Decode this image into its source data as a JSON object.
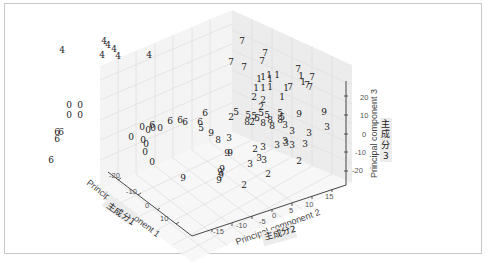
{
  "chart_data": {
    "type": "scatter",
    "subtype": "3d-scatter-text-markers",
    "title": "",
    "axes": {
      "x": {
        "label": "Principal component 1",
        "annotation": "主成分1",
        "ticks": [
          "-20",
          "-10",
          "0",
          "10"
        ]
      },
      "y": {
        "label": "Principal component 2",
        "annotation": "主成分2",
        "ticks": [
          "-15",
          "-10",
          "-5",
          "0",
          "5",
          "10",
          "15"
        ]
      },
      "z": {
        "label": "Principal component 3",
        "annotation": "主成分\n3",
        "ticks": [
          "-20",
          "-10",
          "0",
          "10",
          "20"
        ]
      }
    },
    "grid": true,
    "legend": null,
    "marker_labels": [
      "0",
      "1",
      "2",
      "3",
      "4",
      "5",
      "6",
      "7",
      "8",
      "9"
    ],
    "points_px": [
      {
        "l": "4",
        "x": 62,
        "y": 53
      },
      {
        "l": "4",
        "x": 104,
        "y": 44
      },
      {
        "l": "4",
        "x": 108,
        "y": 48
      },
      {
        "l": "4",
        "x": 114,
        "y": 52
      },
      {
        "l": "4",
        "x": 102,
        "y": 58
      },
      {
        "l": "4",
        "x": 118,
        "y": 59
      },
      {
        "l": "4",
        "x": 149,
        "y": 58
      },
      {
        "l": "7",
        "x": 231,
        "y": 65
      },
      {
        "l": "7",
        "x": 242,
        "y": 44
      },
      {
        "l": "7",
        "x": 244,
        "y": 70
      },
      {
        "l": "7",
        "x": 265,
        "y": 56
      },
      {
        "l": "7",
        "x": 262,
        "y": 64
      },
      {
        "l": "7",
        "x": 298,
        "y": 72
      },
      {
        "l": "7",
        "x": 312,
        "y": 80
      },
      {
        "l": "7",
        "x": 307,
        "y": 88
      },
      {
        "l": "7",
        "x": 310,
        "y": 90
      },
      {
        "l": "7",
        "x": 290,
        "y": 90
      },
      {
        "l": "1",
        "x": 259,
        "y": 82
      },
      {
        "l": "1",
        "x": 263,
        "y": 80
      },
      {
        "l": "1",
        "x": 269,
        "y": 78
      },
      {
        "l": "1",
        "x": 277,
        "y": 78
      },
      {
        "l": "1",
        "x": 256,
        "y": 91
      },
      {
        "l": "1",
        "x": 263,
        "y": 91
      },
      {
        "l": "1",
        "x": 270,
        "y": 90
      },
      {
        "l": "1",
        "x": 286,
        "y": 91
      },
      {
        "l": "1",
        "x": 301,
        "y": 79
      },
      {
        "l": "1",
        "x": 303,
        "y": 85
      },
      {
        "l": "1",
        "x": 282,
        "y": 100
      },
      {
        "l": "1",
        "x": 270,
        "y": 82
      },
      {
        "l": "2",
        "x": 254,
        "y": 100
      },
      {
        "l": "2",
        "x": 263,
        "y": 103
      },
      {
        "l": "2",
        "x": 261,
        "y": 110
      },
      {
        "l": "2",
        "x": 231,
        "y": 120
      },
      {
        "l": "2",
        "x": 252,
        "y": 125
      },
      {
        "l": "2",
        "x": 255,
        "y": 152
      },
      {
        "l": "2",
        "x": 299,
        "y": 164
      },
      {
        "l": "2",
        "x": 268,
        "y": 177
      },
      {
        "l": "2",
        "x": 244,
        "y": 188
      },
      {
        "l": "5",
        "x": 236,
        "y": 115
      },
      {
        "l": "5",
        "x": 254,
        "y": 119
      },
      {
        "l": "5",
        "x": 261,
        "y": 116
      },
      {
        "l": "5",
        "x": 267,
        "y": 118
      },
      {
        "l": "5",
        "x": 280,
        "y": 116
      },
      {
        "l": "5",
        "x": 282,
        "y": 120
      },
      {
        "l": "5",
        "x": 201,
        "y": 131
      },
      {
        "l": "5",
        "x": 257,
        "y": 121
      },
      {
        "l": "5",
        "x": 248,
        "y": 118
      },
      {
        "l": "8",
        "x": 280,
        "y": 123
      },
      {
        "l": "8",
        "x": 270,
        "y": 123
      },
      {
        "l": "8",
        "x": 263,
        "y": 126
      },
      {
        "l": "8",
        "x": 272,
        "y": 129
      },
      {
        "l": "8",
        "x": 218,
        "y": 143
      },
      {
        "l": "8",
        "x": 247,
        "y": 125
      },
      {
        "l": "3",
        "x": 285,
        "y": 128
      },
      {
        "l": "3",
        "x": 292,
        "y": 134
      },
      {
        "l": "3",
        "x": 327,
        "y": 130
      },
      {
        "l": "3",
        "x": 277,
        "y": 148
      },
      {
        "l": "3",
        "x": 285,
        "y": 144
      },
      {
        "l": "3",
        "x": 292,
        "y": 148
      },
      {
        "l": "3",
        "x": 305,
        "y": 147
      },
      {
        "l": "3",
        "x": 263,
        "y": 150
      },
      {
        "l": "3",
        "x": 286,
        "y": 146
      },
      {
        "l": "3",
        "x": 259,
        "y": 161
      },
      {
        "l": "3",
        "x": 264,
        "y": 163
      },
      {
        "l": "3",
        "x": 250,
        "y": 167
      },
      {
        "l": "3",
        "x": 229,
        "y": 141
      },
      {
        "l": "3",
        "x": 309,
        "y": 136
      },
      {
        "l": "9",
        "x": 299,
        "y": 117
      },
      {
        "l": "9",
        "x": 324,
        "y": 115
      },
      {
        "l": "9",
        "x": 211,
        "y": 136
      },
      {
        "l": "9",
        "x": 227,
        "y": 156
      },
      {
        "l": "9",
        "x": 230,
        "y": 156
      },
      {
        "l": "9",
        "x": 222,
        "y": 172
      },
      {
        "l": "9",
        "x": 220,
        "y": 175
      },
      {
        "l": "9",
        "x": 221,
        "y": 178
      },
      {
        "l": "9",
        "x": 219,
        "y": 183
      },
      {
        "l": "9",
        "x": 183,
        "y": 181
      },
      {
        "l": "6",
        "x": 205,
        "y": 116
      },
      {
        "l": "6",
        "x": 170,
        "y": 124
      },
      {
        "l": "6",
        "x": 180,
        "y": 123
      },
      {
        "l": "6",
        "x": 185,
        "y": 125
      },
      {
        "l": "6",
        "x": 200,
        "y": 125
      },
      {
        "l": "6",
        "x": 152,
        "y": 128
      },
      {
        "l": "6",
        "x": 57,
        "y": 135
      },
      {
        "l": "6",
        "x": 61,
        "y": 135
      },
      {
        "l": "6",
        "x": 57,
        "y": 142
      },
      {
        "l": "6",
        "x": 51,
        "y": 163
      },
      {
        "l": "0",
        "x": 69,
        "y": 108
      },
      {
        "l": "0",
        "x": 80,
        "y": 108
      },
      {
        "l": "0",
        "x": 69,
        "y": 118
      },
      {
        "l": "0",
        "x": 80,
        "y": 118
      },
      {
        "l": "0",
        "x": 142,
        "y": 130
      },
      {
        "l": "0",
        "x": 148,
        "y": 133
      },
      {
        "l": "0",
        "x": 153,
        "y": 131
      },
      {
        "l": "0",
        "x": 160,
        "y": 131
      },
      {
        "l": "0",
        "x": 131,
        "y": 140
      },
      {
        "l": "0",
        "x": 143,
        "y": 143
      },
      {
        "l": "0",
        "x": 146,
        "y": 147
      },
      {
        "l": "0",
        "x": 145,
        "y": 155
      },
      {
        "l": "0",
        "x": 152,
        "y": 165
      }
    ]
  },
  "labels": {
    "x_axis": "Principal component 1",
    "x_annotation": "主成分1",
    "y_axis": "Principal component 2",
    "y_annotation": "主成分2",
    "z_axis": "Principal component 3",
    "z_annotation_line1": "主",
    "z_annotation_line2": "成",
    "z_annotation_line3": "分",
    "z_annotation_line4": "3"
  },
  "ticks": {
    "x": [
      {
        "t": "-20",
        "x": 109,
        "y": 178
      },
      {
        "t": "-10",
        "x": 126,
        "y": 194
      },
      {
        "t": "0",
        "x": 145,
        "y": 208
      },
      {
        "t": "10",
        "x": 160,
        "y": 221
      }
    ],
    "y": [
      {
        "t": "-15",
        "x": 213,
        "y": 234
      },
      {
        "t": "-10",
        "x": 236,
        "y": 228
      },
      {
        "t": "-5",
        "x": 259,
        "y": 224
      },
      {
        "t": "0",
        "x": 272,
        "y": 218
      },
      {
        "t": "5",
        "x": 289,
        "y": 213
      },
      {
        "t": "10",
        "x": 305,
        "y": 207
      },
      {
        "t": "15",
        "x": 325,
        "y": 199
      }
    ],
    "z": [
      {
        "t": "20",
        "x": 360,
        "y": 100
      },
      {
        "t": "10",
        "x": 360,
        "y": 118
      },
      {
        "t": "0",
        "x": 362,
        "y": 137
      },
      {
        "t": "-10",
        "x": 355,
        "y": 155
      },
      {
        "t": "-20",
        "x": 352,
        "y": 173
      }
    ]
  }
}
